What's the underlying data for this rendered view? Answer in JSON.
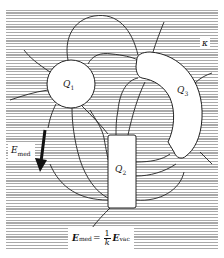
{
  "diagram": {
    "type": "electric field lines in a dielectric medium",
    "conductors": [
      {
        "id": "Q1",
        "label": "Q",
        "subscript": "1",
        "shape": "circle"
      },
      {
        "id": "Q2",
        "label": "Q",
        "subscript": "2",
        "shape": "rectangle"
      },
      {
        "id": "Q3",
        "label": "Q",
        "subscript": "3",
        "shape": "curved-arc-slab"
      }
    ],
    "medium_label": "κ",
    "field_arrow": {
      "label": "E",
      "subscript": "med",
      "direction": "down"
    },
    "formula": {
      "lhs": "E",
      "lhs_sub": "med",
      "equals": "=",
      "frac_num": "1",
      "frac_den": "k",
      "rhs": "E",
      "rhs_sub": "vac"
    },
    "colors": {
      "stripe": "#a9a9a9",
      "line": "#222222",
      "conductor_fill": "#ffffff"
    }
  }
}
